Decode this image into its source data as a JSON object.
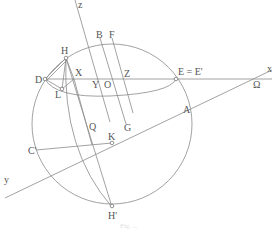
{
  "figure": {
    "type": "geometric diagram",
    "caption": "Fig. ...",
    "colors": {
      "stroke": "#8a8a8a",
      "text": "#555555",
      "background": "#ffffff"
    }
  },
  "labels": {
    "z": "z",
    "x": "x",
    "y": "y",
    "B": "B",
    "F": "F",
    "H": "H",
    "D": "D",
    "X": "X",
    "Z": "Z",
    "Y": "Y",
    "O": "O",
    "L": "L",
    "E": "E = E'",
    "Omega": "Ω",
    "A": "A",
    "Q": "Q",
    "K": "K",
    "G": "G",
    "C": "C'",
    "Hp": "H'"
  }
}
